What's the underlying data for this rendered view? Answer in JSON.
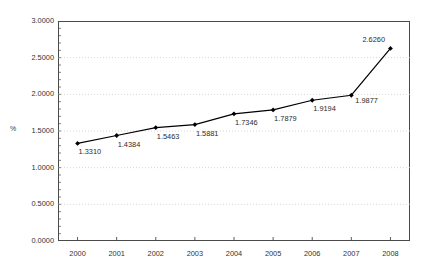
{
  "chart_data": {
    "type": "line",
    "title": "",
    "xlabel": "",
    "ylabel": "%",
    "categories": [
      "2000",
      "2001",
      "2002",
      "2003",
      "2004",
      "2005",
      "2006",
      "2007",
      "2008"
    ],
    "values": [
      1.331,
      1.4384,
      1.5463,
      1.5881,
      1.7346,
      1.7879,
      1.9194,
      1.9877,
      2.626
    ],
    "point_labels": [
      "1.3310",
      "1.4384",
      "1.5463",
      "1.5881",
      "1.7346",
      "1.7879",
      "1.9194",
      "1.9877",
      "2.6260"
    ],
    "ylim": [
      0.0,
      3.0
    ],
    "y_ticks": [
      "0.0000",
      "0.5000",
      "1.0000",
      "1.5000",
      "2.0000",
      "2.5000",
      "3.0000"
    ],
    "y_tick_values": [
      0.0,
      0.5,
      1.0,
      1.5,
      2.0,
      2.5,
      3.0
    ],
    "grid": true,
    "legend": "none",
    "series_color": "#000000",
    "grid_color": "#cccccc",
    "axis_color": "#4a4a4a",
    "marker": "diamond"
  }
}
